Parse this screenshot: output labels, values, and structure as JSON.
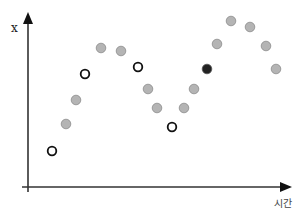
{
  "chart_data": {
    "type": "scatter",
    "title": "",
    "xlabel": "시간",
    "ylabel": "x",
    "grid": false,
    "legend": null,
    "axes": {
      "origin": [
        28,
        187
      ],
      "x_end": 291,
      "y_end": 13
    },
    "colors": {
      "axis": "#333333",
      "gray_fill": "#b4b4b4",
      "gray_stroke": "#8c8c8c",
      "open_stroke": "#111111",
      "dark_fill": "#222222"
    },
    "points": [
      {
        "x": 52,
        "y": 151,
        "style": "open"
      },
      {
        "x": 66,
        "y": 124,
        "style": "gray"
      },
      {
        "x": 76,
        "y": 100,
        "style": "gray"
      },
      {
        "x": 85,
        "y": 74,
        "style": "open"
      },
      {
        "x": 101,
        "y": 48,
        "style": "gray"
      },
      {
        "x": 121,
        "y": 51,
        "style": "gray"
      },
      {
        "x": 138,
        "y": 67,
        "style": "open"
      },
      {
        "x": 148,
        "y": 89,
        "style": "gray"
      },
      {
        "x": 157,
        "y": 108,
        "style": "gray"
      },
      {
        "x": 172,
        "y": 127,
        "style": "open"
      },
      {
        "x": 184,
        "y": 108,
        "style": "gray"
      },
      {
        "x": 194,
        "y": 89,
        "style": "gray"
      },
      {
        "x": 207,
        "y": 69,
        "style": "dark"
      },
      {
        "x": 217,
        "y": 44,
        "style": "gray"
      },
      {
        "x": 231,
        "y": 21,
        "style": "gray"
      },
      {
        "x": 250,
        "y": 27,
        "style": "gray"
      },
      {
        "x": 266,
        "y": 46,
        "style": "gray"
      },
      {
        "x": 276,
        "y": 69,
        "style": "gray"
      }
    ]
  }
}
